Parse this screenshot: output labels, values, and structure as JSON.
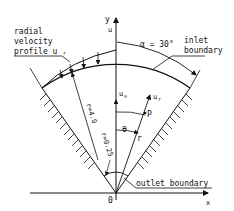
{
  "diagram": {
    "type": "wedge-flow-geometry",
    "labels": {
      "profile_line1": "radial",
      "profile_line2": "velocity",
      "profile_line3": "profile u",
      "profile_sub": "r",
      "alpha": "α = 30°",
      "inlet_line1": "inlet",
      "inlet_line2": "boundary",
      "outlet": "outlet boundary",
      "r_outer": "r=4.0",
      "r_inner": "r=0.25",
      "u_infinity": "u",
      "u_infinity_sub": "∞",
      "u_r": "u",
      "u_r_sub": "r",
      "u_axis": "u",
      "point_p": "P",
      "r_symbol": "r",
      "theta": "θ",
      "origin": "0",
      "x_axis": "x",
      "y_axis": "y"
    },
    "colors": {
      "ink": "#111111",
      "background": "#ffffff"
    }
  }
}
